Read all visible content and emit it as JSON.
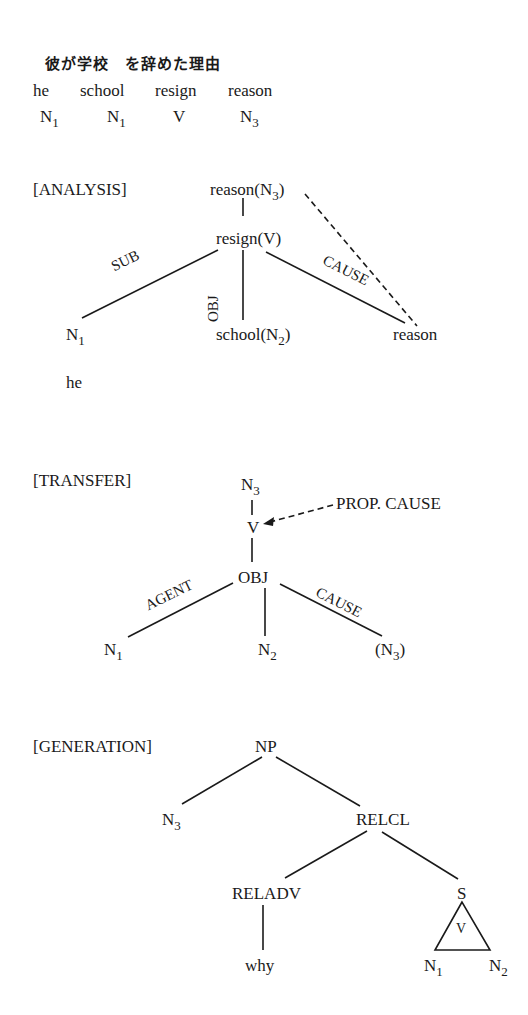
{
  "header": {
    "japanese": "彼が学校　を辞めた理由",
    "gloss": [
      "he",
      "school",
      "resign",
      "reason"
    ],
    "tags": [
      {
        "base": "N",
        "sub": "1"
      },
      {
        "base": "N",
        "sub": "1"
      },
      {
        "base": "V",
        "sub": ""
      },
      {
        "base": "N",
        "sub": "3"
      }
    ]
  },
  "analysis": {
    "title": "[ANALYSIS]",
    "root": {
      "base": "reason(N",
      "sub": "3",
      "close": ")"
    },
    "verb": "resign(V)",
    "edges": {
      "sub": "SUB",
      "obj": "OBJ",
      "cause": "CAUSE"
    },
    "subject": {
      "base": "N",
      "sub": "1"
    },
    "subject_word": "he",
    "object": {
      "base": "school(N",
      "sub": "2",
      "close": ")"
    },
    "cause": "reason"
  },
  "transfer": {
    "title": "[TRANSFER]",
    "root": {
      "base": "N",
      "sub": "3"
    },
    "verb": "V",
    "prop": "PROP. CAUSE",
    "obj": "OBJ",
    "edges": {
      "agent": "AGENT",
      "cause": "CAUSE"
    },
    "agent": {
      "base": "N",
      "sub": "1"
    },
    "object": {
      "base": "N",
      "sub": "2"
    },
    "cause": {
      "open": "(",
      "base": "N",
      "sub": "3",
      "close": ")"
    }
  },
  "generation": {
    "title": "[GENERATION]",
    "np": "NP",
    "n3": {
      "base": "N",
      "sub": "3"
    },
    "relcl": "RELCL",
    "reladv": "RELADV",
    "why": "why",
    "s": "S",
    "triangle_v": "V",
    "n1": {
      "base": "N",
      "sub": "1"
    },
    "n2": {
      "base": "N",
      "sub": "2"
    }
  }
}
